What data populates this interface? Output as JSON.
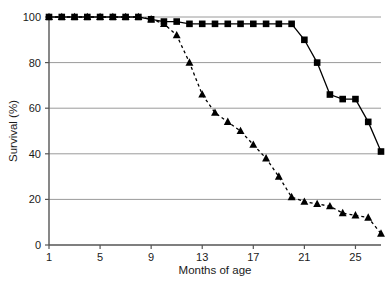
{
  "chart_data": {
    "type": "line",
    "title": "",
    "subtitle": "",
    "xlabel": "Months of age",
    "ylabel": "Survival (%)",
    "xlim": [
      1,
      27
    ],
    "ylim": [
      0,
      100
    ],
    "xticks": [
      1,
      5,
      9,
      13,
      17,
      21,
      25
    ],
    "xtick_labels": [
      "1",
      "5",
      "9",
      "13",
      "17",
      "21",
      "25"
    ],
    "yticks": [
      0,
      20,
      40,
      60,
      80,
      100
    ],
    "ytick_labels": [
      "0",
      "20",
      "40",
      "60",
      "80",
      "100"
    ],
    "grid": "horizontal",
    "grid_color": "#9a9a9a",
    "legend": "none",
    "legend_position": "none",
    "axis_color": "#555555",
    "series": [
      {
        "name": "square-series",
        "marker": "square",
        "linestyle": "solid",
        "color": "#000000",
        "x": [
          1,
          2,
          3,
          4,
          5,
          6,
          7,
          8,
          9,
          10,
          11,
          12,
          13,
          14,
          15,
          16,
          17,
          18,
          19,
          20,
          21,
          22,
          23,
          24,
          25,
          26,
          27
        ],
        "values": [
          100,
          100,
          100,
          100,
          100,
          100,
          100,
          100,
          99,
          98,
          98,
          97,
          97,
          97,
          97,
          97,
          97,
          97,
          97,
          97,
          90,
          80,
          66,
          64,
          64,
          54,
          41
        ]
      },
      {
        "name": "triangle-series",
        "marker": "triangle",
        "linestyle": "dashed",
        "color": "#000000",
        "x": [
          1,
          2,
          3,
          4,
          5,
          6,
          7,
          8,
          9,
          10,
          11,
          12,
          13,
          14,
          15,
          16,
          17,
          18,
          19,
          20,
          21,
          22,
          23,
          24,
          25,
          26,
          27
        ],
        "values": [
          100,
          100,
          100,
          100,
          100,
          100,
          100,
          100,
          99,
          97,
          92,
          80,
          66,
          58,
          54,
          50,
          44,
          38,
          30,
          21,
          19,
          18,
          17,
          14,
          13,
          12,
          5
        ]
      }
    ]
  },
  "axes": {
    "ylabel_text": "Survival (%)",
    "xlabel_text": "Months of age"
  }
}
